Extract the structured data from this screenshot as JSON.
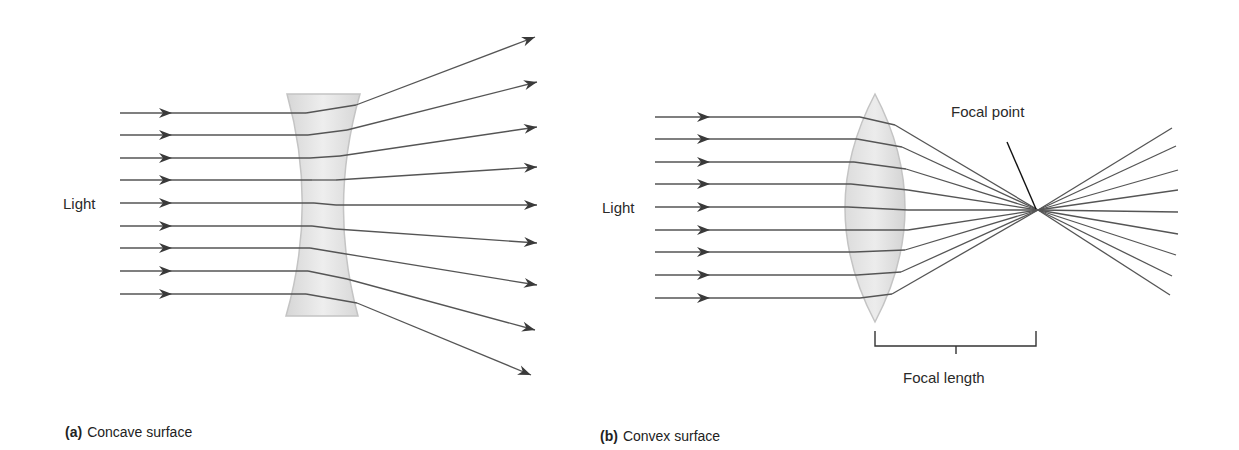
{
  "panel_a": {
    "caption_letter": "(a)",
    "caption_text": "Concave surface",
    "light_label": "Light",
    "lens_type": "concave",
    "incoming_rays_y": [
      113,
      135,
      158,
      180,
      203,
      226,
      248,
      271,
      294
    ],
    "exit_points": [
      [
        356,
        105
      ],
      [
        347,
        130
      ],
      [
        340,
        156
      ],
      [
        336,
        180
      ],
      [
        336,
        205
      ],
      [
        336,
        229
      ],
      [
        340,
        253
      ],
      [
        347,
        279
      ],
      [
        357,
        303
      ]
    ],
    "outgoing_tips": [
      [
        535,
        37
      ],
      [
        537,
        82
      ],
      [
        537,
        127
      ],
      [
        537,
        167
      ],
      [
        537,
        205
      ],
      [
        537,
        243
      ],
      [
        537,
        285
      ],
      [
        535,
        330
      ],
      [
        531,
        375
      ]
    ]
  },
  "panel_b": {
    "caption_letter": "(b)",
    "caption_text": "Convex surface",
    "light_label": "Light",
    "lens_type": "convex",
    "focal_point_label": "Focal point",
    "focal_length_label": "Focal length",
    "incoming_rays_y": [
      117,
      139,
      162,
      184,
      207,
      230,
      252,
      275,
      298
    ],
    "exit_points": [
      [
        895,
        125
      ],
      [
        902,
        147
      ],
      [
        906,
        169
      ],
      [
        908,
        190
      ],
      [
        908,
        210
      ],
      [
        908,
        230
      ],
      [
        905,
        250
      ],
      [
        901,
        272
      ],
      [
        892,
        294
      ]
    ],
    "focal_point": [
      1038,
      210
    ],
    "outgoing_ends": [
      [
        1172,
        128
      ],
      [
        1176,
        146
      ],
      [
        1178,
        170
      ],
      [
        1178,
        190
      ],
      [
        1178,
        212
      ],
      [
        1178,
        234
      ],
      [
        1176,
        255
      ],
      [
        1172,
        276
      ],
      [
        1170,
        295
      ]
    ]
  },
  "colors": {
    "ray": "#555555",
    "arrowhead": "#3a3a3a",
    "lens_fill": "#e3e3e3",
    "lens_edge": "#c4c4c4",
    "bracket": "#333333"
  }
}
